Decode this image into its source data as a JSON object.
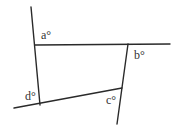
{
  "diagram": {
    "angles": [
      {
        "id": "a",
        "label": "a°"
      },
      {
        "id": "b",
        "label": "b°"
      },
      {
        "id": "c",
        "label": "c°"
      },
      {
        "id": "d",
        "label": "d°"
      }
    ],
    "colors": {
      "line": "#2a2a2a",
      "text": "#333333",
      "background": "#ffffff"
    }
  }
}
